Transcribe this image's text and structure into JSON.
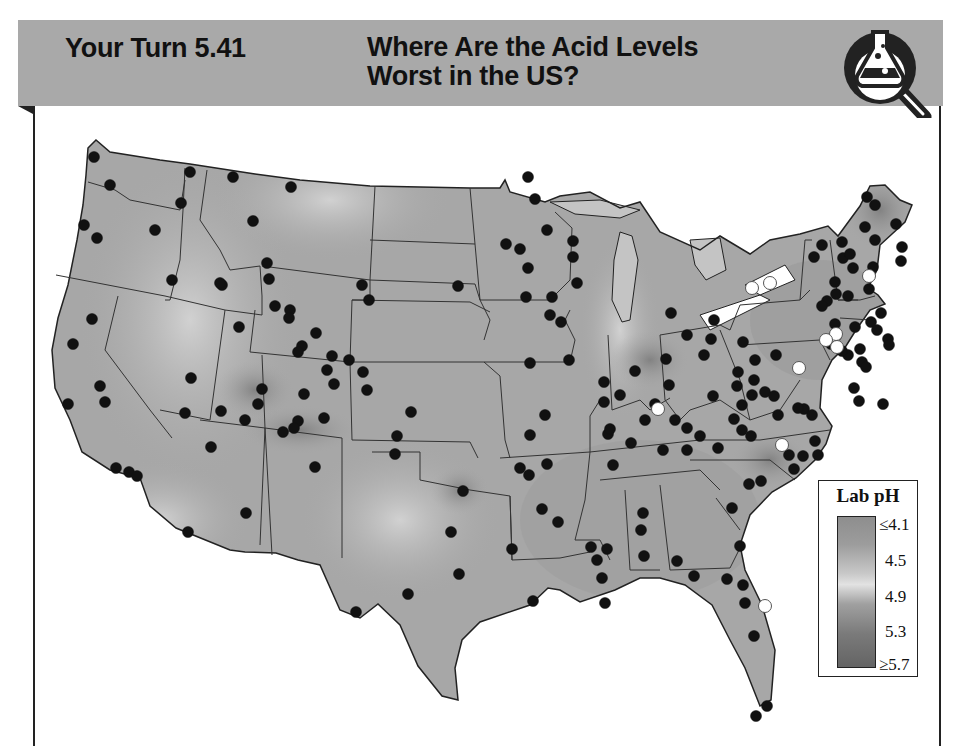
{
  "header": {
    "label": "Your Turn 5.41",
    "title_line1": "Where Are the Acid Levels",
    "title_line2": "Worst in the US?",
    "icon": "flask-magnifier-icon"
  },
  "chart_data": {
    "type": "scatter",
    "title": "Where Are the Acid Levels Worst in the US?",
    "subtitle": "Your Turn 5.41",
    "legend": {
      "title": "Lab pH",
      "position": "lower-right",
      "ticks": [
        "≤4.1",
        "4.5",
        "4.9",
        "5.3",
        "≥5.7"
      ],
      "values": [
        4.1,
        4.5,
        4.9,
        5.3,
        5.7
      ],
      "colors": [
        "#8e8e8e",
        "#b3b3b3",
        "#e2e2e2",
        "#8a8a8a",
        "#646464"
      ]
    },
    "grid": false,
    "series": [
      {
        "name": "monitoring sites",
        "marker": "black-dot",
        "points_px": [
          [
            94,
            157
          ],
          [
            110,
            185
          ],
          [
            84,
            225
          ],
          [
            97,
            238
          ],
          [
            155,
            230
          ],
          [
            190,
            172
          ],
          [
            181,
            203
          ],
          [
            233,
            177
          ],
          [
            291,
            187
          ],
          [
            253,
            221
          ],
          [
            267,
            263
          ],
          [
            222,
            285
          ],
          [
            172,
            280
          ],
          [
            220,
            283
          ],
          [
            269,
            279
          ],
          [
            275,
            306
          ],
          [
            290,
            310
          ],
          [
            289,
            318
          ],
          [
            239,
            327
          ],
          [
            302,
            346
          ],
          [
            298,
            352
          ],
          [
            316,
            333
          ],
          [
            349,
            360
          ],
          [
            332,
            356
          ],
          [
            327,
            370
          ],
          [
            334,
            384
          ],
          [
            304,
            394
          ],
          [
            262,
            389
          ],
          [
            258,
            404
          ],
          [
            221,
            411
          ],
          [
            191,
            378
          ],
          [
            185,
            413
          ],
          [
            245,
            420
          ],
          [
            283,
            432
          ],
          [
            298,
            421
          ],
          [
            324,
            418
          ],
          [
            294,
            428
          ],
          [
            363,
            372
          ],
          [
            367,
            390
          ],
          [
            211,
            447
          ],
          [
            315,
            467
          ],
          [
            188,
            532
          ],
          [
            246,
            513
          ],
          [
            92,
            319
          ],
          [
            73,
            344
          ],
          [
            100,
            386
          ],
          [
            68,
            404
          ],
          [
            105,
            402
          ],
          [
            116,
            468
          ],
          [
            129,
            472
          ],
          [
            137,
            476
          ],
          [
            362,
            285
          ],
          [
            369,
            300
          ],
          [
            395,
            454
          ],
          [
            397,
            436
          ],
          [
            463,
            491
          ],
          [
            451,
            532
          ],
          [
            459,
            574
          ],
          [
            512,
            549
          ],
          [
            408,
            594
          ],
          [
            356,
            612
          ],
          [
            411,
            412
          ],
          [
            458,
            286
          ],
          [
            545,
            415
          ],
          [
            530,
            435
          ],
          [
            520,
            468
          ],
          [
            547,
            464
          ],
          [
            542,
            509
          ],
          [
            558,
            522
          ],
          [
            533,
            601
          ],
          [
            529,
            475
          ],
          [
            608,
            434
          ],
          [
            613,
            465
          ],
          [
            607,
            549
          ],
          [
            591,
            547
          ],
          [
            597,
            560
          ],
          [
            602,
            578
          ],
          [
            605,
            603
          ],
          [
            643,
            513
          ],
          [
            641,
            530
          ],
          [
            644,
            556
          ],
          [
            663,
            450
          ],
          [
            687,
            450
          ],
          [
            687,
            428
          ],
          [
            749,
            484
          ],
          [
            732,
            508
          ],
          [
            740,
            546
          ],
          [
            694,
            576
          ],
          [
            677,
            561
          ],
          [
            727,
            579
          ],
          [
            743,
            585
          ],
          [
            761,
            481
          ],
          [
            745,
            603
          ],
          [
            754,
            636
          ],
          [
            767,
            706
          ],
          [
            756,
            716
          ],
          [
            528,
            177
          ],
          [
            535,
            199
          ],
          [
            506,
            244
          ],
          [
            520,
            249
          ],
          [
            547,
            230
          ],
          [
            573,
            241
          ],
          [
            573,
            257
          ],
          [
            577,
            283
          ],
          [
            552,
            297
          ],
          [
            528,
            268
          ],
          [
            526,
            297
          ],
          [
            550,
            315
          ],
          [
            530,
            363
          ],
          [
            561,
            322
          ],
          [
            569,
            360
          ],
          [
            604,
            402
          ],
          [
            604,
            382
          ],
          [
            620,
            395
          ],
          [
            645,
            420
          ],
          [
            655,
            404
          ],
          [
            669,
            385
          ],
          [
            666,
            359
          ],
          [
            635,
            371
          ],
          [
            610,
            429
          ],
          [
            631,
            443
          ],
          [
            687,
            335
          ],
          [
            671,
            313
          ],
          [
            675,
            420
          ],
          [
            704,
            355
          ],
          [
            700,
            436
          ],
          [
            711,
            339
          ],
          [
            714,
            320
          ],
          [
            713,
            396
          ],
          [
            718,
            448
          ],
          [
            734,
            419
          ],
          [
            737,
            386
          ],
          [
            738,
            372
          ],
          [
            742,
            405
          ],
          [
            742,
            430
          ],
          [
            743,
            342
          ],
          [
            751,
            436
          ],
          [
            755,
            360
          ],
          [
            754,
            380
          ],
          [
            752,
            395
          ],
          [
            765,
            392
          ],
          [
            776,
            355
          ],
          [
            794,
            469
          ],
          [
            789,
            455
          ],
          [
            804,
            409
          ],
          [
            815,
            441
          ],
          [
            818,
            455
          ],
          [
            867,
            197
          ],
          [
            875,
            205
          ],
          [
            865,
            227
          ],
          [
            875,
            240
          ],
          [
            873,
            267
          ],
          [
            896,
            224
          ],
          [
            902,
            247
          ],
          [
            901,
            261
          ],
          [
            842,
            242
          ],
          [
            843,
            258
          ],
          [
            850,
            254
          ],
          [
            853,
            268
          ],
          [
            848,
            296
          ],
          [
            835,
            282
          ],
          [
            869,
            289
          ],
          [
            822,
            245
          ],
          [
            814,
            257
          ],
          [
            855,
            327
          ],
          [
            871,
            322
          ],
          [
            877,
            330
          ],
          [
            860,
            349
          ],
          [
            827,
            301
          ],
          [
            822,
            306
          ],
          [
            835,
            324
          ],
          [
            831,
            344
          ],
          [
            854,
            388
          ],
          [
            774,
            396
          ],
          [
            778,
            415
          ],
          [
            798,
            408
          ],
          [
            862,
            362
          ],
          [
            881,
            313
          ],
          [
            888,
            339
          ],
          [
            889,
            345
          ],
          [
            866,
            367
          ],
          [
            848,
            355
          ],
          [
            859,
            401
          ],
          [
            883,
            404
          ],
          [
            842,
            351
          ],
          [
            803,
            456
          ],
          [
            812,
            415
          ],
          [
            836,
            294
          ]
        ]
      },
      {
        "name": "highlighted sites",
        "marker": "white-dot",
        "points_px": [
          [
            752,
            288
          ],
          [
            770,
            283
          ],
          [
            869,
            276
          ],
          [
            835,
            336
          ],
          [
            836,
            334
          ],
          [
            826,
            340
          ],
          [
            837,
            347
          ],
          [
            799,
            368
          ],
          [
            658,
            409
          ],
          [
            782,
            445
          ],
          [
            765,
            606
          ]
        ]
      }
    ]
  }
}
